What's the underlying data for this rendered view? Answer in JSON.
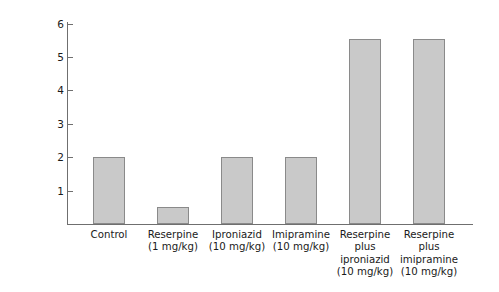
{
  "chart_data": {
    "type": "bar",
    "title": "",
    "xlabel": "",
    "ylabel": "Locomotor activity (arbitrary units)",
    "ylim": [
      0,
      6.4
    ],
    "yticks": [
      1,
      2,
      3,
      4,
      5,
      6
    ],
    "ytick_labels": [
      "1",
      "2",
      "3",
      "4",
      "5",
      "6"
    ],
    "grid": false,
    "legend": "none",
    "bar_color": "#c9c9c9",
    "bar_edge_color": "#8a8a8a",
    "axis_color": "#6f6f6f",
    "background": "#ffffff",
    "categories": [
      "Control",
      "Reserpine\n(1 mg/kg)",
      "Iproniazid\n(10 mg/kg)",
      "Imipramine\n(10 mg/kg)",
      "Reserpine\nplus\niproniazid\n(10 mg/kg)",
      "Reserpine\nplus\nimipramine\n(10 mg/kg)"
    ],
    "values": [
      2.0,
      0.5,
      2.0,
      2.0,
      5.55,
      5.55
    ]
  },
  "axis": {
    "y_title": "Locomotor activity (arbitrary units)"
  }
}
